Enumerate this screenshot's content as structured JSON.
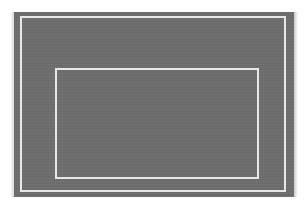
{
  "image": {
    "description": "Gray rectangular panel with a white outer border line and a smaller centered white-outlined inner rectangle",
    "background_color": "#ffffff",
    "panel_color": "#6e6e6e",
    "line_color": "#e8e8e8",
    "shapes": [
      {
        "name": "gray-panel",
        "x": 14,
        "y": 12,
        "width": 280,
        "height": 185
      },
      {
        "name": "outer-frame",
        "x": 20,
        "y": 16,
        "width": 266,
        "height": 176
      },
      {
        "name": "inner-frame",
        "x": 55,
        "y": 68,
        "width": 204,
        "height": 111
      }
    ]
  }
}
